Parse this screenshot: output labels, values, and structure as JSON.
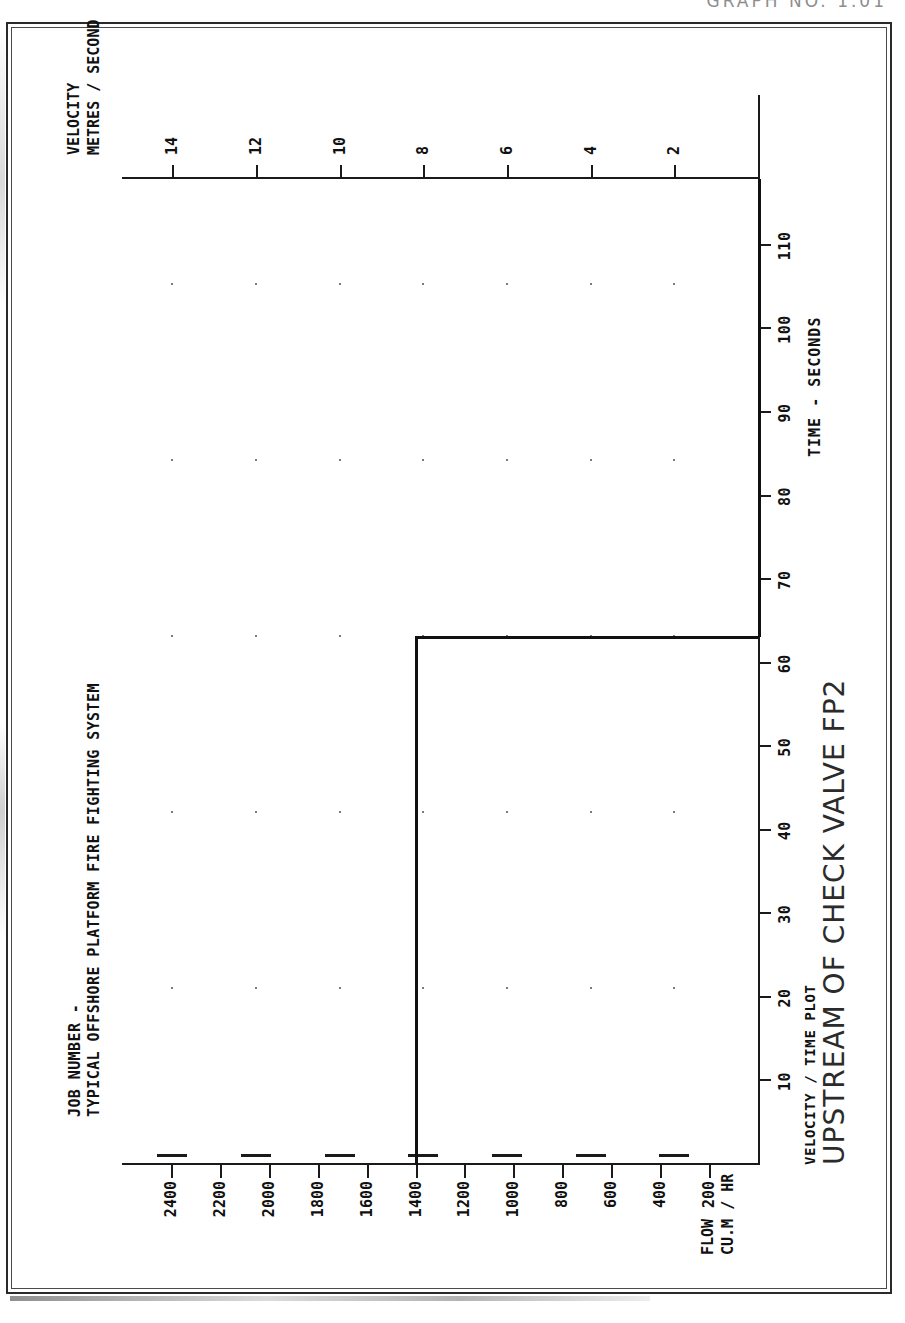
{
  "document": {
    "top_header": "GRAPH NO.  1.01"
  },
  "header": {
    "line1": "JOB NUMBER -",
    "line2": "TYPICAL OFFSHORE PLATFORM FIRE FIGHTING SYSTEM"
  },
  "footer": {
    "subtitle": "VELOCITY / TIME PLOT",
    "title": "UPSTREAM OF CHECK VALVE FP2"
  },
  "axis_labels": {
    "left_line1": "FLOW",
    "left_line2": "CU.M / HR",
    "right_line1": "VELOCITY",
    "right_line2": "METRES / SECOND",
    "x": "TIME - SECONDS"
  },
  "chart_data": {
    "type": "line",
    "title": "UPSTREAM OF CHECK VALVE FP2",
    "subtitle": "VELOCITY / TIME PLOT",
    "xlabel": "TIME - SECONDS",
    "ylabel": "FLOW  CU.M / HR",
    "y2label": "VELOCITY  METRES / SECOND",
    "grid": "dots",
    "legend": "none",
    "xlim": [
      0,
      118
    ],
    "xticks": [
      10,
      20,
      30,
      40,
      50,
      60,
      70,
      80,
      90,
      100,
      110
    ],
    "ylim": [
      0,
      2600
    ],
    "yticks": [
      200,
      400,
      600,
      800,
      1000,
      1200,
      1400,
      1600,
      1800,
      2000,
      2200,
      2400
    ],
    "y2lim": [
      0,
      15.2
    ],
    "y2ticks": [
      2,
      4,
      6,
      8,
      10,
      12,
      14
    ],
    "series": [
      {
        "name": "velocity",
        "x": [
          0,
          63,
          63.2,
          118
        ],
        "y": [
          8.2,
          8.2,
          0.0,
          0.0
        ]
      }
    ],
    "annotations": [
      "Steady velocity of approximately 8.2 m/s (approx. 1400 cu.m/hr) from t=0 s to t=63 s, then flow stops abruptly."
    ]
  }
}
